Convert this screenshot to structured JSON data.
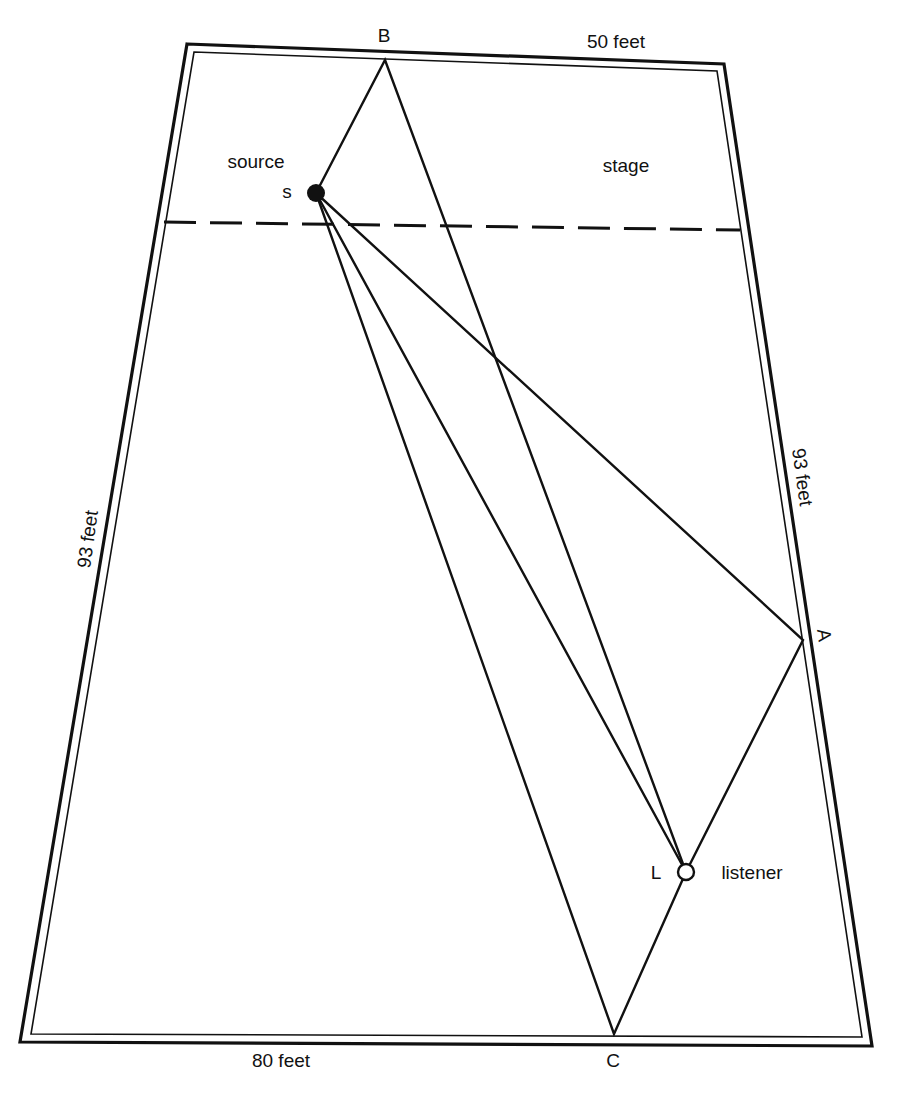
{
  "figure": {
    "labels": {
      "top_width": "50 feet",
      "bottom_width": "80 feet",
      "left_side": "93 feet",
      "right_side": "93 feet",
      "stage": "stage",
      "source": "source",
      "source_point": "s",
      "listener": "listener",
      "listener_point": "L",
      "reflection_a": "A",
      "reflection_b": "B",
      "reflection_c": "C"
    },
    "colors": {
      "ink": "#111111",
      "background": "#ffffff"
    },
    "geometry": {
      "hall_outer": [
        [
          187,
          44
        ],
        [
          724,
          64
        ],
        [
          872,
          1046
        ],
        [
          20,
          1042
        ]
      ],
      "hall_inner": [
        [
          194,
          52
        ],
        [
          717,
          71
        ],
        [
          862,
          1037
        ],
        [
          31,
          1034
        ]
      ],
      "stage_line": [
        [
          164,
          222
        ],
        [
          740,
          230
        ]
      ],
      "source": [
        316,
        193
      ],
      "listener": [
        686,
        872
      ],
      "point_a": [
        803,
        640
      ],
      "point_b": [
        385,
        60
      ],
      "point_c": [
        614,
        1034
      ]
    },
    "paths": [
      {
        "name": "direct",
        "from": "s",
        "to": "L"
      },
      {
        "name": "via-A",
        "from": "s",
        "via": "A",
        "to": "L"
      },
      {
        "name": "via-B",
        "from": "s",
        "via": "B",
        "to": "L"
      },
      {
        "name": "via-C",
        "from": "s",
        "via": "C",
        "to": "L"
      }
    ]
  }
}
